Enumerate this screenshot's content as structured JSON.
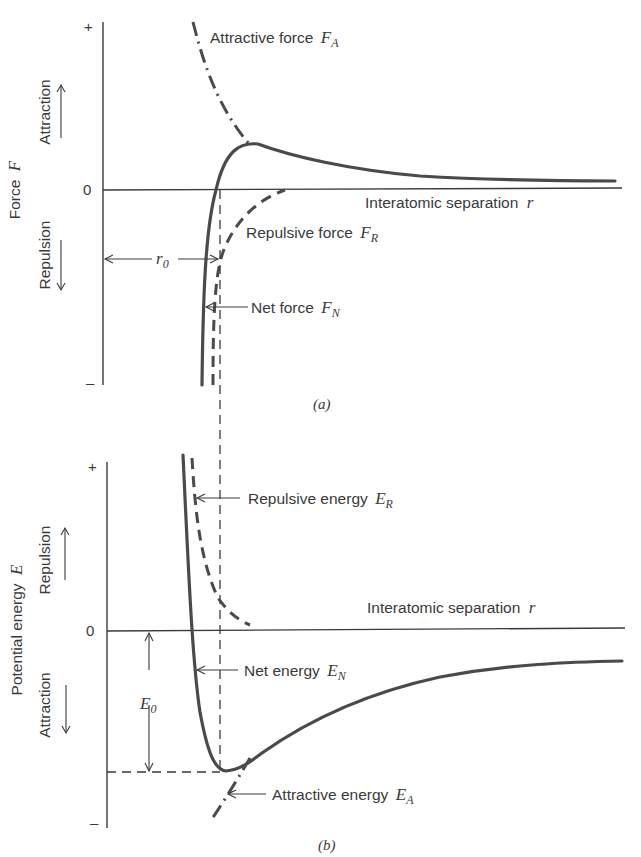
{
  "figure": {
    "panel_a": {
      "caption": "(a)",
      "y_axis_label": "Force",
      "y_axis_symbol": "F",
      "direction_up": "Attraction",
      "direction_down": "Repulsion",
      "tick_plus": "+",
      "tick_zero": "0",
      "tick_minus": "–",
      "x_axis_label": "Interatomic separation",
      "x_axis_symbol": "r",
      "curves": {
        "attractive": {
          "label": "Attractive force",
          "symbol": "F",
          "subscript": "A",
          "style": "dash-dot"
        },
        "repulsive": {
          "label": "Repulsive force",
          "symbol": "F",
          "subscript": "R",
          "style": "dashed"
        },
        "net": {
          "label": "Net force",
          "symbol": "F",
          "subscript": "N",
          "style": "solid"
        }
      },
      "r0": {
        "symbol": "r",
        "subscript": "0"
      }
    },
    "panel_b": {
      "caption": "(b)",
      "y_axis_label": "Potential energy",
      "y_axis_symbol": "E",
      "direction_up": "Repulsion",
      "direction_down": "Attraction",
      "tick_plus": "+",
      "tick_zero": "0",
      "tick_minus": "–",
      "x_axis_label": "Interatomic separation",
      "x_axis_symbol": "r",
      "curves": {
        "repulsive": {
          "label": "Repulsive energy",
          "symbol": "E",
          "subscript": "R",
          "style": "dashed"
        },
        "net": {
          "label": "Net energy",
          "symbol": "E",
          "subscript": "N",
          "style": "solid"
        },
        "attractive": {
          "label": "Attractive energy",
          "symbol": "E",
          "subscript": "A",
          "style": "dash-dot"
        }
      },
      "e0": {
        "symbol": "E",
        "subscript": "0"
      }
    }
  }
}
